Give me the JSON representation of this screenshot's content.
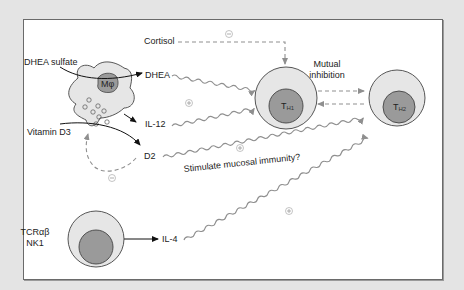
{
  "diagram": {
    "title": "",
    "colors": {
      "background": "#e4e4e4",
      "panel": "#ffffff",
      "cell_outer": "#e6e6e6",
      "cell_nucleus": "#9a9a9a",
      "arrow_gray": "#8f8f8f",
      "arrow_black": "#111111"
    },
    "nodes": {
      "macrophage": {
        "label": "Mφ"
      },
      "th1": {
        "label": "TH1",
        "main": "T",
        "sub": "H1"
      },
      "th2": {
        "label": "TH2",
        "main": "T",
        "sub": "H2"
      },
      "nkt": {
        "label_line1": "TCRαβ",
        "label_line2": "NK1"
      }
    },
    "labels": {
      "cortisol": "Cortisol",
      "dhea_sulfate": "DHEA sulfate",
      "dhea": "DHEA",
      "il12": "IL-12",
      "vitamin_d3": "Vitamin D3",
      "d2": "D2",
      "il4": "IL-4",
      "mutual_line1": "Mutual",
      "mutual_line2": "inhibition",
      "stimulate": "Stimulate mucosal immunity?"
    },
    "signs": {
      "cortisol_effect": "⊖",
      "dhea_il12_effect": "⊕",
      "d2_feedback": "⊖",
      "d2_effect": "⊕",
      "il4_effect": "⊕"
    },
    "edges": [
      {
        "from": "DHEA sulfate",
        "to": "DHEA",
        "style": "solid-arrow"
      },
      {
        "from": "Macrophage",
        "to": "IL-12",
        "style": "solid-arrow"
      },
      {
        "from": "Vitamin D3",
        "to": "D2",
        "style": "solid-arrow"
      },
      {
        "from": "Cortisol",
        "to": "TH1",
        "style": "dashed-arrow",
        "effect": "inhibit"
      },
      {
        "from": "DHEA",
        "to": "TH1",
        "style": "wavy-arrow",
        "effect": "stimulate"
      },
      {
        "from": "IL-12",
        "to": "TH1",
        "style": "wavy-arrow",
        "effect": "stimulate"
      },
      {
        "from": "D2",
        "to": "Macrophage",
        "style": "dashed-arrow",
        "effect": "inhibit"
      },
      {
        "from": "D2",
        "to": "TH2",
        "style": "wavy-arrow",
        "effect": "stimulate"
      },
      {
        "from": "TH1",
        "to": "TH2",
        "style": "dashed-arrow",
        "effect": "mutual inhibition"
      },
      {
        "from": "TH2",
        "to": "TH1",
        "style": "dashed-arrow",
        "effect": "mutual inhibition"
      },
      {
        "from": "TCRαβ NK1",
        "to": "IL-4",
        "style": "solid-arrow"
      },
      {
        "from": "IL-4",
        "to": "TH2",
        "style": "wavy-arrow",
        "effect": "stimulate"
      }
    ]
  }
}
